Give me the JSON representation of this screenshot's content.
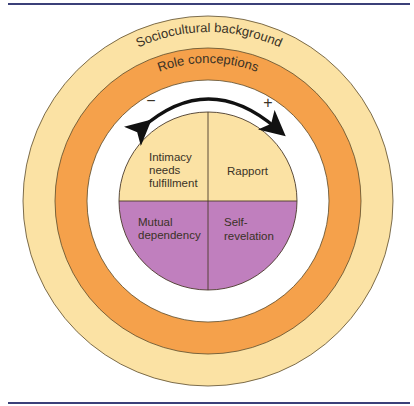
{
  "diagram": {
    "rings": [
      {
        "label": "Sociocultural background",
        "color": "#FBE2A4"
      },
      {
        "label": "Role conceptions",
        "color": "#F5A14B"
      }
    ],
    "arrow": {
      "minus": "−",
      "plus": "+"
    },
    "quadrants": {
      "top_left": {
        "lines": [
          "Intimacy",
          "needs",
          "fulfillment"
        ],
        "color": "#FBE2A4"
      },
      "top_right": {
        "lines": [
          "Rapport"
        ],
        "color": "#FBE2A4"
      },
      "bottom_left": {
        "lines": [
          "Mutual",
          "dependency"
        ],
        "color": "#C07FBE"
      },
      "bottom_right": {
        "lines": [
          "Self-",
          "revelation"
        ],
        "color": "#C07FBE"
      }
    },
    "rule_color": "#3B4079"
  }
}
